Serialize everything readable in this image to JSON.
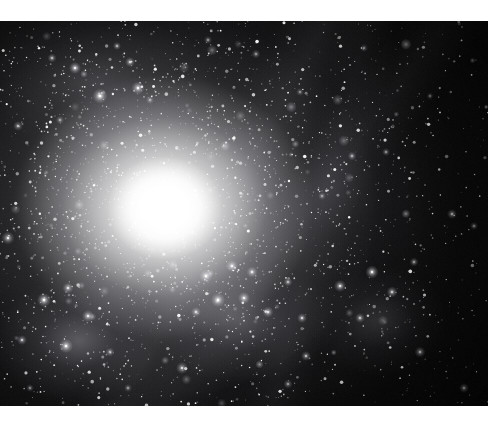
{
  "page": {
    "background_color": "#ffffff",
    "width": 504,
    "height": 422
  },
  "image": {
    "kind": "astronomical-photograph",
    "subject": "elliptical galaxy with bright saturated nucleus, diffuse halo and dense surrounding star field",
    "frame": {
      "x": 0,
      "y": 21,
      "width": 488,
      "height": 385
    },
    "background_color": "#000000",
    "alt_text": "Deep-sky photograph: a brilliant white galaxy core left of centre surrounded by a broad glowing halo, set against a dense field of stars and fuzzy star clusters."
  },
  "nucleus": {
    "center_x": 165,
    "center_y": 187,
    "core_color": "#ffffff",
    "halo_color": "#e8e8ee",
    "core_radius": 29,
    "halo_radius": 300
  },
  "features": [
    {
      "name": "core-glow",
      "x": 165,
      "y": 187,
      "rx": 150,
      "ry": 132,
      "intensity": 1.0
    },
    {
      "name": "outer-halo",
      "x": 164,
      "y": 187,
      "rx": 300,
      "ry": 265,
      "intensity": 0.6
    },
    {
      "name": "upper-left-nebulosity",
      "x": 96,
      "y": 62,
      "rx": 120,
      "ry": 70,
      "intensity": 0.2
    },
    {
      "name": "mid-right-glow",
      "x": 330,
      "y": 170,
      "rx": 105,
      "ry": 90,
      "intensity": 0.13
    },
    {
      "name": "lower-left-cluster",
      "x": 78,
      "y": 320,
      "rx": 85,
      "ry": 62,
      "intensity": 0.32
    },
    {
      "name": "lower-center-cluster",
      "x": 240,
      "y": 300,
      "rx": 95,
      "ry": 62,
      "intensity": 0.26
    },
    {
      "name": "lower-right-cluster",
      "x": 378,
      "y": 300,
      "rx": 70,
      "ry": 55,
      "intensity": 0.2
    }
  ],
  "starfield": {
    "point_star_count": 2600,
    "fuzzy_blob_count": 58,
    "seed": 20240517,
    "star_color": "#ffffff",
    "description": "dense field of unresolved point stars plus resolved globular-cluster-like fuzzy blobs"
  },
  "bright_blobs": [
    {
      "x": 75,
      "y": 68,
      "r": 6.0,
      "b": 0.82
    },
    {
      "x": 100,
      "y": 96,
      "r": 7.5,
      "b": 0.9
    },
    {
      "x": 130,
      "y": 62,
      "r": 5.0,
      "b": 0.7
    },
    {
      "x": 138,
      "y": 88,
      "r": 6.5,
      "b": 0.8
    },
    {
      "x": 52,
      "y": 58,
      "r": 4.5,
      "b": 0.62
    },
    {
      "x": 60,
      "y": 120,
      "r": 4.0,
      "b": 0.52
    },
    {
      "x": 18,
      "y": 126,
      "r": 5.0,
      "b": 0.55
    },
    {
      "x": 117,
      "y": 46,
      "r": 4.0,
      "b": 0.6
    },
    {
      "x": 150,
      "y": 100,
      "r": 4.0,
      "b": 0.52
    },
    {
      "x": 8,
      "y": 238,
      "r": 6.5,
      "b": 0.7
    },
    {
      "x": 44,
      "y": 300,
      "r": 7.0,
      "b": 0.86
    },
    {
      "x": 68,
      "y": 288,
      "r": 5.5,
      "b": 0.72
    },
    {
      "x": 88,
      "y": 316,
      "r": 6.0,
      "b": 0.78
    },
    {
      "x": 66,
      "y": 346,
      "r": 7.0,
      "b": 0.84
    },
    {
      "x": 22,
      "y": 340,
      "r": 5.0,
      "b": 0.62
    },
    {
      "x": 110,
      "y": 352,
      "r": 4.5,
      "b": 0.58
    },
    {
      "x": 206,
      "y": 276,
      "r": 6.5,
      "b": 0.86
    },
    {
      "x": 232,
      "y": 266,
      "r": 6.0,
      "b": 0.82
    },
    {
      "x": 252,
      "y": 272,
      "r": 5.5,
      "b": 0.76
    },
    {
      "x": 218,
      "y": 300,
      "r": 7.0,
      "b": 0.9
    },
    {
      "x": 244,
      "y": 298,
      "r": 6.0,
      "b": 0.8
    },
    {
      "x": 268,
      "y": 312,
      "r": 5.5,
      "b": 0.74
    },
    {
      "x": 196,
      "y": 312,
      "r": 5.0,
      "b": 0.7
    },
    {
      "x": 288,
      "y": 282,
      "r": 4.5,
      "b": 0.62
    },
    {
      "x": 302,
      "y": 318,
      "r": 5.0,
      "b": 0.66
    },
    {
      "x": 340,
      "y": 286,
      "r": 6.0,
      "b": 0.74
    },
    {
      "x": 372,
      "y": 272,
      "r": 6.5,
      "b": 0.8
    },
    {
      "x": 392,
      "y": 292,
      "r": 5.5,
      "b": 0.72
    },
    {
      "x": 360,
      "y": 318,
      "r": 5.0,
      "b": 0.66
    },
    {
      "x": 414,
      "y": 262,
      "r": 4.5,
      "b": 0.58
    },
    {
      "x": 352,
      "y": 156,
      "r": 4.5,
      "b": 0.56
    },
    {
      "x": 386,
      "y": 152,
      "r": 4.0,
      "b": 0.5
    },
    {
      "x": 322,
      "y": 196,
      "r": 4.0,
      "b": 0.48
    },
    {
      "x": 452,
      "y": 214,
      "r": 5.0,
      "b": 0.56
    },
    {
      "x": 474,
      "y": 226,
      "r": 4.0,
      "b": 0.48
    },
    {
      "x": 182,
      "y": 368,
      "r": 6.0,
      "b": 0.66
    },
    {
      "x": 306,
      "y": 356,
      "r": 5.0,
      "b": 0.58
    },
    {
      "x": 420,
      "y": 352,
      "r": 5.5,
      "b": 0.62
    },
    {
      "x": 464,
      "y": 388,
      "r": 5.0,
      "b": 0.58
    },
    {
      "x": 288,
      "y": 384,
      "r": 4.5,
      "b": 0.52
    },
    {
      "x": 128,
      "y": 388,
      "r": 4.0,
      "b": 0.46
    },
    {
      "x": 30,
      "y": 388,
      "r": 4.0,
      "b": 0.44
    },
    {
      "x": 256,
      "y": 54,
      "r": 4.5,
      "b": 0.46
    },
    {
      "x": 300,
      "y": 92,
      "r": 4.0,
      "b": 0.42
    },
    {
      "x": 364,
      "y": 48,
      "r": 4.0,
      "b": 0.44
    },
    {
      "x": 430,
      "y": 96,
      "r": 3.5,
      "b": 0.38
    },
    {
      "x": 208,
      "y": 40,
      "r": 4.0,
      "b": 0.46
    }
  ]
}
